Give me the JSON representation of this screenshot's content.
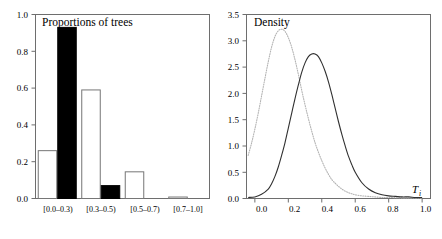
{
  "figure": {
    "width": 442,
    "height": 239,
    "background": "#ffffff"
  },
  "chart_data": [
    {
      "type": "bar",
      "title": "Proportions of trees",
      "xlabel": "",
      "ylabel": "",
      "categories": [
        "[0.0–0.3)",
        "[0.3–0.5)",
        "[0.5–0.7)",
        "[0.7–1.0]"
      ],
      "series": [
        {
          "name": "open",
          "style": "white-filled outlined bar",
          "color": "#ffffff",
          "values": [
            0.26,
            0.59,
            0.145,
            0.008
          ]
        },
        {
          "name": "solid",
          "style": "black filled bar",
          "color": "#000000",
          "values": [
            0.93,
            0.07,
            0.0,
            0.0
          ]
        }
      ],
      "ylim": [
        0.0,
        1.0
      ],
      "yticks": [
        "0.0",
        "0.2",
        "0.4",
        "0.6",
        "0.8",
        "1.0"
      ],
      "ytick_values": [
        0.0,
        0.2,
        0.4,
        0.6,
        0.8,
        1.0
      ],
      "grid": false,
      "legend": "none"
    },
    {
      "type": "line",
      "title": "Density",
      "xlabel": "T",
      "xlabel_sub": "i",
      "ylabel": "",
      "xlim": [
        0.0,
        1.0
      ],
      "ylim": [
        0.0,
        3.5
      ],
      "xticks": [
        "0.0",
        "0.2",
        "0.4",
        "0.6",
        "0.8",
        "1.0"
      ],
      "xtick_values": [
        0.0,
        0.2,
        0.4,
        0.6,
        0.8,
        1.0
      ],
      "yticks": [
        "0.0",
        "0.5",
        "1.0",
        "1.5",
        "2.0",
        "2.5",
        "3.0",
        "3.5"
      ],
      "ytick_values": [
        0.0,
        0.5,
        1.0,
        1.5,
        2.0,
        2.5,
        3.0,
        3.5
      ],
      "grid": false,
      "legend": "none",
      "series": [
        {
          "name": "dotted-density",
          "style": "dotted",
          "color": "#b4b4b4",
          "peak_x": 0.16,
          "peak_y": 3.22,
          "x": [
            -0.04,
            -0.02,
            0.0,
            0.02,
            0.04,
            0.06,
            0.08,
            0.1,
            0.12,
            0.14,
            0.16,
            0.18,
            0.2,
            0.22,
            0.24,
            0.26,
            0.28,
            0.3,
            0.32,
            0.34,
            0.36,
            0.38,
            0.4,
            0.42,
            0.44,
            0.46,
            0.48,
            0.5,
            0.52,
            0.54,
            0.56,
            0.58,
            0.6,
            0.64,
            0.68,
            0.72,
            0.76,
            0.8,
            0.9,
            1.0
          ],
          "y": [
            0.82,
            1.05,
            1.32,
            1.62,
            1.95,
            2.28,
            2.6,
            2.88,
            3.08,
            3.19,
            3.22,
            3.18,
            3.06,
            2.88,
            2.64,
            2.36,
            2.06,
            1.78,
            1.52,
            1.28,
            1.06,
            0.88,
            0.72,
            0.58,
            0.46,
            0.36,
            0.29,
            0.23,
            0.18,
            0.14,
            0.11,
            0.09,
            0.07,
            0.05,
            0.04,
            0.03,
            0.02,
            0.02,
            0.01,
            0.01
          ]
        },
        {
          "name": "solid-density",
          "style": "solid",
          "color": "#303030",
          "peak_x": 0.36,
          "peak_y": 2.75,
          "x": [
            -0.04,
            0.0,
            0.04,
            0.08,
            0.1,
            0.12,
            0.14,
            0.16,
            0.18,
            0.2,
            0.22,
            0.24,
            0.26,
            0.28,
            0.3,
            0.32,
            0.34,
            0.36,
            0.38,
            0.4,
            0.42,
            0.44,
            0.46,
            0.48,
            0.5,
            0.52,
            0.54,
            0.56,
            0.58,
            0.6,
            0.64,
            0.68,
            0.72,
            0.76,
            0.8,
            0.84,
            0.88,
            0.92,
            0.96,
            1.0
          ],
          "y": [
            0.02,
            0.03,
            0.08,
            0.18,
            0.28,
            0.42,
            0.6,
            0.82,
            1.06,
            1.34,
            1.62,
            1.9,
            2.16,
            2.4,
            2.58,
            2.7,
            2.75,
            2.75,
            2.7,
            2.58,
            2.42,
            2.22,
            1.98,
            1.72,
            1.46,
            1.22,
            1.0,
            0.8,
            0.64,
            0.5,
            0.3,
            0.18,
            0.11,
            0.07,
            0.05,
            0.04,
            0.03,
            0.03,
            0.02,
            0.02
          ]
        }
      ]
    }
  ],
  "panels": {
    "left": {
      "title": "Proportions of trees",
      "yticks": [
        "1.0",
        "0.8",
        "0.6",
        "0.4",
        "0.2",
        "0.0"
      ],
      "categories": [
        "[0.0–0.3)",
        "[0.3–0.5)",
        "[0.5–0.7)",
        "[0.7–1.0]"
      ]
    },
    "right": {
      "title": "Density",
      "yticks": [
        "3.5",
        "3.0",
        "2.5",
        "2.0",
        "1.5",
        "1.0",
        "0.5",
        "0.0"
      ],
      "xticks": [
        "0.0",
        "0.2",
        "0.4",
        "0.6",
        "0.8",
        "1.0"
      ],
      "axis_label": "T",
      "axis_label_sub": "i"
    }
  }
}
